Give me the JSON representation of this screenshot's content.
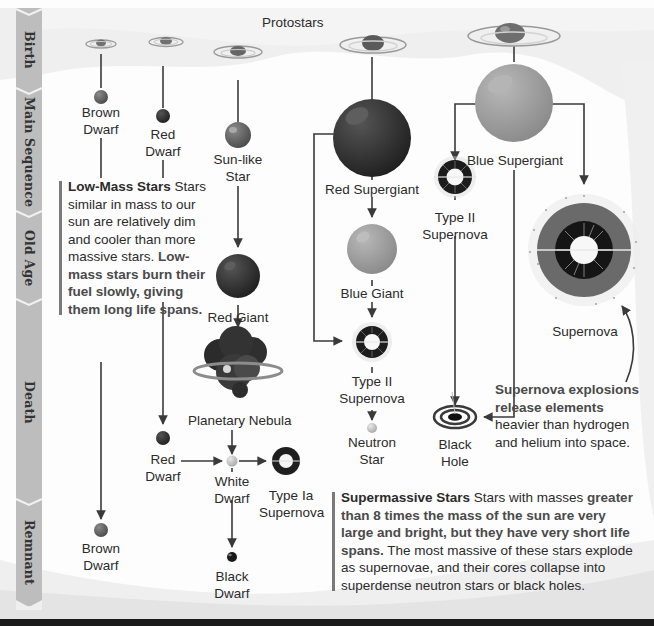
{
  "stages": [
    {
      "label": "Birth"
    },
    {
      "label": "Main Sequence"
    },
    {
      "label": "Old Age"
    },
    {
      "label": "Death"
    },
    {
      "label": "Remnant"
    }
  ],
  "header": {
    "protostars_label": "Protostars"
  },
  "low_mass_path": {
    "brown_dwarf_main": "Brown\nDwarf",
    "red_dwarf_main": "Red\nDwarf",
    "red_dwarf_death": "Red\nDwarf",
    "brown_dwarf_remnant": "Brown\nDwarf"
  },
  "sunlike_path": {
    "sunlike_star": "Sun-like\nStar",
    "red_giant": "Red Giant",
    "planetary_nebula": "Planetary Nebula",
    "white_dwarf": "White\nDwarf",
    "type_ia_supernova": "Type Ia\nSupernova",
    "black_dwarf": "Black\nDwarf"
  },
  "red_supergiant_path": {
    "red_supergiant": "Red Supergiant",
    "blue_giant": "Blue Giant",
    "type_ii_supernova": "Type II\nSupernova",
    "neutron_star": "Neutron\nStar"
  },
  "blue_supergiant_path": {
    "blue_supergiant": "Blue Supergiant",
    "type_ii_supernova": "Type II\nSupernova",
    "black_hole": "Black\nHole",
    "supernova": "Supernova"
  },
  "notes": {
    "low_mass": {
      "title": "Low-Mass Stars",
      "text1": " Stars similar in mass to our sun are relatively dim and cooler than more massive stars. ",
      "bold2": "Low-mass stars burn their fuel slowly, giving them long life spans."
    },
    "supernova": {
      "bold1": "Supernova explosions release elements",
      "text1": " heavier than hydrogen and helium into space."
    },
    "supermassive": {
      "title": "Supermassive Stars",
      "text1": " Stars with masses ",
      "bold2": "greater than 8 times the mass of the sun are very large and bright, but they have very short life spans.",
      "text2": " The most massive of these stars explode as supernovae, and their cores collapse into superdense neutron stars or black holes."
    }
  },
  "colors": {
    "band": "#bdbdbd",
    "line": "#3a3a3a",
    "dark_star": "#2e2e2e",
    "mid_star": "#7c7c7c",
    "light_star": "#a8a8a8",
    "text": "#2b2b2b"
  }
}
